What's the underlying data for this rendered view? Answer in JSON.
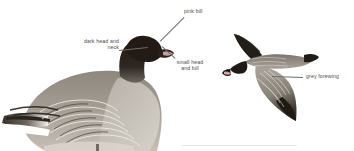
{
  "plate": {
    "background_color": "#ffffff",
    "width": 354,
    "height": 151,
    "subject": "goose-identification-plate"
  },
  "figures": [
    {
      "id": "standing-goose",
      "name": "standing-goose-illustration",
      "pose": "standing, side profile facing right",
      "colors": {
        "head_neck": "#241c16",
        "body_upper": "#8c857c",
        "body_lower": "#b8b2a9",
        "feather_edge": "#f2f0ec",
        "wing_dark": "#39332c",
        "bill_pink": "#c9a0a0",
        "leg": "#6f6a62"
      }
    },
    {
      "id": "flying-goose",
      "name": "flying-goose-illustration",
      "pose": "in flight, side profile facing left",
      "colors": {
        "head_neck": "#1f1a15",
        "forewing_grey": "#9a948b",
        "wing_dark": "#2e2820",
        "body": "#7d766d",
        "bill_pink": "#cfa6a6"
      }
    }
  ],
  "annotations": [
    {
      "id": "pink-bill",
      "text": "pink bill",
      "align": "left",
      "x": 184,
      "y": 8,
      "leader": {
        "x1": 184,
        "y1": 17,
        "x2": 160,
        "y2": 41
      }
    },
    {
      "id": "dark-head-and-neck",
      "text": "dark head and\nneck",
      "align": "right",
      "x": 70,
      "y": 39,
      "leader": {
        "x1": 119,
        "y1": 50,
        "x2": 148,
        "y2": 47
      }
    },
    {
      "id": "small-head-and-bill",
      "text": "small head\nand bill",
      "align": "center",
      "x": 177,
      "y": 59,
      "leader": {
        "x1": 175,
        "y1": 58,
        "x2": 162,
        "y2": 46
      }
    },
    {
      "id": "grey-forewing",
      "text": "grey forewing",
      "align": "left",
      "x": 305,
      "y": 74,
      "leader": {
        "x1": 272,
        "y1": 76,
        "x2": 303,
        "y2": 77
      }
    }
  ],
  "divider": {
    "id": "bottom-rule",
    "x": 182,
    "y": 145,
    "width": 115,
    "color": "#e6e6e6"
  }
}
